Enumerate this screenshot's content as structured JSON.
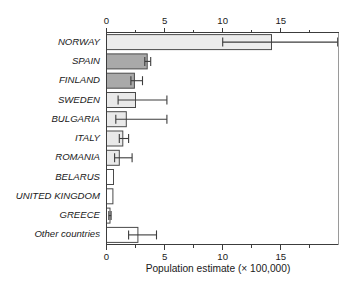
{
  "chart_data": {
    "type": "bar",
    "orientation": "horizontal",
    "title": "",
    "xlabel": "Population estimate (× 100,000)",
    "ylabel": "",
    "xlim": [
      0,
      19.9
    ],
    "xticks": [
      0,
      5,
      10,
      15
    ],
    "xtick_labels": [
      "0",
      "5",
      "10",
      "15"
    ],
    "xminor_ticks": [
      2.5,
      7.5,
      12.5,
      17.5
    ],
    "grid": false,
    "legend": null,
    "axis_positions": [
      "top",
      "bottom"
    ],
    "categories": [
      "NORWAY",
      "SPAIN",
      "FINLAND",
      "SWEDEN",
      "BULGARIA",
      "ITALY",
      "ROMANIA",
      "BELARUS",
      "UNITED KINGDOM",
      "GREECE",
      "Other countries"
    ],
    "values": [
      14.2,
      3.5,
      2.4,
      2.5,
      1.7,
      1.4,
      1.1,
      0.6,
      0.55,
      0.3,
      2.7
    ],
    "error_low": [
      10.0,
      3.3,
      2.1,
      1.0,
      0.8,
      1.1,
      0.7,
      null,
      null,
      0.2,
      1.9
    ],
    "error_high": [
      19.9,
      3.8,
      3.1,
      5.2,
      5.2,
      1.9,
      2.2,
      null,
      null,
      0.4,
      4.3
    ],
    "bar_colors": [
      "#ececec",
      "#a9a9a9",
      "#a9a9a9",
      "#e9e9e9",
      "#e9e9e9",
      "#e9e9e9",
      "#e9e9e9",
      "#ffffff",
      "#ffffff",
      "#ffffff",
      "#ffffff"
    ],
    "bar_edge_color": "#4a4a4a",
    "error_color": "#3c3c3c",
    "axis_color": "#3c3c3c"
  },
  "axis": {
    "xlabel": "Population estimate (× 100,000)",
    "tick_labels": [
      "0",
      "5",
      "10",
      "15"
    ]
  }
}
